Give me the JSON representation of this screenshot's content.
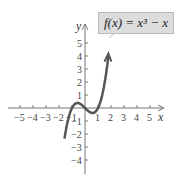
{
  "chart_data": {
    "type": "line",
    "title": "",
    "function_label": "f(x) = x³ − x",
    "xlabel": "x",
    "ylabel": "y",
    "xlim": [
      -5.5,
      5.5
    ],
    "ylim": [
      -5,
      5.5
    ],
    "x_ticks": [
      -5,
      -4,
      -3,
      -2,
      -1,
      1,
      2,
      3,
      4,
      5
    ],
    "y_ticks": [
      -4,
      -3,
      -2,
      -1,
      1,
      2,
      3,
      4,
      5
    ],
    "x_tick_labels": [
      "−5",
      "−4",
      "−3",
      "−2",
      "−1",
      "1",
      "2",
      "3",
      "4",
      "5"
    ],
    "y_tick_labels": [
      "−4",
      "−3",
      "−2",
      "−1",
      "1",
      "2",
      "3",
      "4",
      "5"
    ],
    "series": [
      {
        "name": "f(x) = x³ − x",
        "x": [
          -1.5,
          -1,
          -0.577,
          0,
          0.577,
          1,
          1.5,
          1.8
        ],
        "y": [
          -1.875,
          0,
          0.385,
          0,
          -0.385,
          0,
          1.875,
          4.03
        ]
      }
    ],
    "grid": false,
    "colors": {
      "curve": "#555555",
      "axis": "#666666",
      "label_bg": "#dcdcdc"
    }
  },
  "label": {
    "text": "f(x) = x³ − x"
  },
  "axes": {
    "x": "x",
    "y": "y"
  }
}
